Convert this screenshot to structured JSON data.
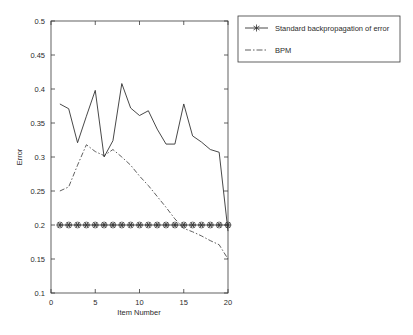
{
  "chart_data": {
    "type": "line",
    "title": "",
    "xlabel": "Item Number",
    "ylabel": "Error",
    "xlim": [
      0,
      20
    ],
    "ylim": [
      0.1,
      0.5
    ],
    "xticks": [
      0,
      5,
      10,
      15,
      20
    ],
    "xtick_labels": [
      "0",
      "5",
      "10",
      "15",
      "20"
    ],
    "yticks": [
      0.1,
      0.15,
      0.2,
      0.25,
      0.3,
      0.35,
      0.4,
      0.45,
      0.5
    ],
    "ytick_labels": [
      "0.1",
      "0.15",
      "0.2",
      "0.25",
      "0.3",
      "0.35",
      "0.4",
      "0.45",
      "0.5"
    ],
    "grid": false,
    "legend_position": "upper right",
    "x": [
      1,
      2,
      3,
      4,
      5,
      6,
      7,
      8,
      9,
      10,
      11,
      12,
      13,
      14,
      15,
      16,
      17,
      18,
      19,
      20
    ],
    "series": [
      {
        "name": "Standard backpropagation of error",
        "style": "solid-with-star-markers",
        "color": "#333333",
        "marker": "hexagram",
        "values": [
          0.378,
          0.371,
          0.321,
          0.36,
          0.398,
          0.3,
          0.324,
          0.408,
          0.372,
          0.361,
          0.368,
          0.341,
          0.319,
          0.319,
          0.378,
          0.331,
          0.322,
          0.311,
          0.307,
          0.191
        ]
      },
      {
        "name": "BPM",
        "style": "dash-dot",
        "color": "#4d4d4d",
        "marker": "none",
        "values": [
          0.25,
          0.256,
          0.288,
          0.318,
          0.308,
          0.302,
          0.311,
          0.3,
          0.288,
          0.272,
          0.258,
          0.242,
          0.226,
          0.209,
          0.195,
          0.19,
          0.184,
          0.177,
          0.171,
          0.15
        ]
      },
      {
        "name": "marker-baseline",
        "style": "solid-marker-row",
        "color": "#333333",
        "marker": "hexagram",
        "values": [
          0.2,
          0.2,
          0.2,
          0.2,
          0.2,
          0.2,
          0.2,
          0.2,
          0.2,
          0.2,
          0.2,
          0.2,
          0.2,
          0.2,
          0.2,
          0.2,
          0.2,
          0.2,
          0.2,
          0.2
        ]
      }
    ],
    "legend_entries": [
      {
        "label": "Standard backpropagation of error",
        "style": "solid-with-star-markers"
      },
      {
        "label": "BPM",
        "style": "dash-dot"
      }
    ]
  }
}
